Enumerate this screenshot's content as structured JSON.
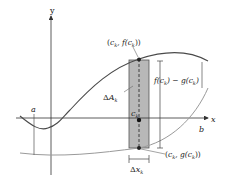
{
  "diagram": {
    "type": "area-between-curves",
    "axes": {
      "x_label": "x",
      "y_label": "y"
    },
    "bounds": {
      "a_label": "a",
      "b_label": "b"
    },
    "strip": {
      "area_label_delta": "Δ",
      "area_label_var": "A",
      "area_label_sub": "k",
      "center_label_var": "c",
      "center_label_sub": "k",
      "width_label_delta": "Δ",
      "width_label_var": "x",
      "width_label_sub": "k"
    },
    "points": {
      "top": {
        "open": "(",
        "c": "c",
        "sub": "k",
        "mid": ", f(",
        "c2": "c",
        "sub2": "k",
        "close": "))"
      },
      "bottom": {
        "open": "(",
        "c": "c",
        "sub": "k",
        "mid": ", g(",
        "c2": "c",
        "sub2": "k",
        "close": "))"
      }
    },
    "height_label": {
      "f": "f(",
      "c1": "c",
      "s1": "k",
      "middle": ") − g(",
      "c2": "c",
      "s2": "k",
      "end": ")"
    },
    "colors": {
      "axis": "#333333",
      "curve_f": "#4a4a4a",
      "curve_g": "#9a9a9a",
      "strip_fill": "#b8b8b8",
      "strip_stroke": "#555555",
      "point": "#222222"
    }
  }
}
